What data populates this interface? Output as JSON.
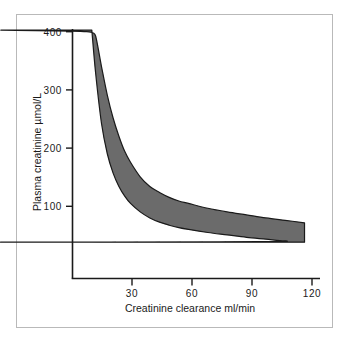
{
  "figure": {
    "background_color": "#ffffff",
    "border_color": "#b9b9b9"
  },
  "chart_data": {
    "type": "area",
    "title": "",
    "subtitle": "",
    "xlabel": "Creatinine clearance ml/min",
    "ylabel": "Plasma creatinine µmol/L",
    "xlim": [
      0,
      128
    ],
    "ylim": [
      0,
      412
    ],
    "xticks": [
      30,
      60,
      90,
      120
    ],
    "xticklabels": [
      "30",
      "60",
      "90",
      "120"
    ],
    "yticks": [
      100,
      200,
      300,
      400
    ],
    "yticklabels": [
      "100",
      "200",
      "300",
      "400"
    ],
    "grid": false,
    "legend": "none",
    "band_fill_color": "#6b6b6b",
    "band_edge_color": "#1a1a1a",
    "axis_color": "#1a1a1a",
    "series": [
      {
        "name": "Upper limit of reference band",
        "x": [
          10,
          12,
          15,
          18,
          21,
          24,
          27,
          30,
          35,
          40,
          45,
          50,
          55,
          60,
          70,
          80,
          90,
          100,
          110,
          120
        ],
        "values": [
          410,
          400,
          350,
          303,
          265,
          235,
          210,
          192,
          168,
          152,
          142,
          134,
          128,
          124,
          116,
          110,
          105,
          100,
          96,
          92
        ]
      },
      {
        "name": "Lower limit of reference band",
        "x": [
          10,
          12,
          15,
          18,
          21,
          24,
          27,
          30,
          35,
          40,
          45,
          50,
          55,
          60,
          70,
          80,
          90,
          100,
          110,
          120
        ],
        "values": [
          410,
          338,
          256,
          206,
          174,
          152,
          136,
          124,
          110,
          100,
          93,
          88,
          84,
          81,
          76,
          72,
          68,
          65,
          62,
          60
        ]
      }
    ],
    "annotations": []
  }
}
